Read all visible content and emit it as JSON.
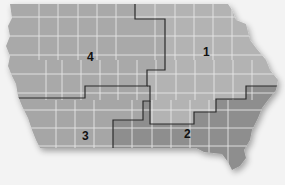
{
  "map": {
    "subject": "Iowa congressional districts",
    "districts": [
      {
        "id": "1",
        "label": "1",
        "fill": "#b3b3b3"
      },
      {
        "id": "2",
        "label": "2",
        "fill": "#8e8e8e"
      },
      {
        "id": "3",
        "label": "3",
        "fill": "#a6a6a6"
      },
      {
        "id": "4",
        "label": "4",
        "fill": "#a9a9a9"
      }
    ],
    "colors": {
      "background": "#f3f3f3",
      "county_lines": "#e8e8e8",
      "district_border": "#2a2a2a"
    }
  }
}
